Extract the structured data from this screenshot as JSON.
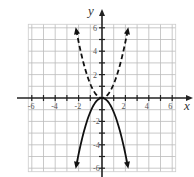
{
  "chart_data": {
    "type": "line",
    "title": "",
    "xlabel": "x",
    "ylabel": "y",
    "xlim": [
      -6.3,
      6.3
    ],
    "ylim": [
      -6.3,
      6.3
    ],
    "grid": true,
    "x_ticks": [
      -6,
      -4,
      -2,
      2,
      4,
      6
    ],
    "y_ticks": [
      6,
      4,
      2,
      -2,
      -4,
      -6
    ],
    "x_tick_labels": [
      "-6",
      "-4",
      "-2",
      "2",
      "4",
      "6"
    ],
    "y_tick_labels": [
      "6",
      "4",
      "2",
      "-2",
      "-4",
      "-6"
    ],
    "series": [
      {
        "name": "dashed curve (opens upward)",
        "style": "dashed",
        "arrows": "both ends",
        "x": [
          -2.2,
          -2,
          -1.5,
          -1,
          -0.5,
          0,
          0.5,
          1,
          1.5,
          2,
          2.2
        ],
        "y": [
          5.8,
          4.8,
          2.7,
          1.2,
          0.3,
          0,
          0.3,
          1.2,
          2.7,
          4.8,
          5.8
        ]
      },
      {
        "name": "solid curve (opens downward)",
        "style": "solid",
        "arrows": "both ends",
        "x": [
          -2.2,
          -2,
          -1.5,
          -1,
          -0.5,
          0,
          0.5,
          1,
          1.5,
          2,
          2.2
        ],
        "y": [
          -5.8,
          -4.8,
          -2.7,
          -1.2,
          -0.3,
          0,
          -0.3,
          -1.2,
          -2.7,
          -4.8,
          -5.8
        ]
      }
    ],
    "legend": null
  },
  "labels": {
    "x_axis": "x",
    "y_axis": "y"
  }
}
